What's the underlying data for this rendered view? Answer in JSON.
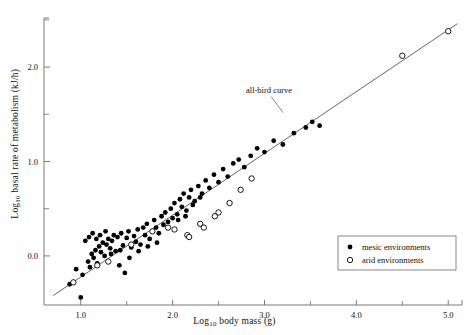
{
  "chart_data": {
    "type": "scatter",
    "title": "",
    "xlabel": "Log10 body mass (g)",
    "ylabel": "Log10 basal rate of metabolism (kJ/h)",
    "xlim": [
      0.6,
      5.15
    ],
    "ylim": [
      -0.52,
      2.52
    ],
    "xticks": [
      1.0,
      2.0,
      3.0,
      4.0,
      5.0
    ],
    "xticklabels": [
      "1.0",
      "2.0",
      "3.0",
      "4.0",
      "5.0"
    ],
    "xminorticks": [
      1.5,
      2.5,
      3.5,
      4.5
    ],
    "yticks": [
      0.0,
      1.0,
      2.0
    ],
    "yticklabels": [
      "0.0",
      "1.0",
      "2.0"
    ],
    "yminorticks": [
      0.5,
      1.5,
      2.5
    ],
    "grid": false,
    "legend_position": "lower-right",
    "annotations": [
      {
        "text": "all-bird curve",
        "x": 3.05,
        "y": 1.73
      }
    ],
    "fit_line": {
      "name": "all-bird curve",
      "x": [
        0.7,
        5.1
      ],
      "y": [
        -0.42,
        2.46
      ],
      "color": "#555555"
    },
    "series": [
      {
        "name": "mesic environments",
        "marker": "filled-circle",
        "color": "#000000",
        "points": [
          [
            0.88,
            -0.3
          ],
          [
            1.0,
            -0.44
          ],
          [
            0.95,
            -0.14
          ],
          [
            1.02,
            -0.2
          ],
          [
            1.08,
            -0.06
          ],
          [
            1.1,
            -0.12
          ],
          [
            1.12,
            0.02
          ],
          [
            1.14,
            -0.02
          ],
          [
            1.16,
            0.06
          ],
          [
            1.18,
            -0.08
          ],
          [
            1.2,
            0.1
          ],
          [
            1.22,
            0.04
          ],
          [
            1.24,
            0.14
          ],
          [
            1.26,
            0.0
          ],
          [
            1.28,
            0.12
          ],
          [
            1.3,
            0.18
          ],
          [
            1.32,
            0.08
          ],
          [
            1.34,
            0.16
          ],
          [
            1.36,
            0.22
          ],
          [
            1.38,
            0.05
          ],
          [
            1.4,
            0.2
          ],
          [
            1.42,
            -0.1
          ],
          [
            1.44,
            0.24
          ],
          [
            1.46,
            0.11
          ],
          [
            1.48,
            -0.18
          ],
          [
            1.5,
            0.19
          ],
          [
            1.52,
            0.26
          ],
          [
            1.55,
            0.09
          ],
          [
            1.58,
            0.21
          ],
          [
            1.6,
            0.15
          ],
          [
            1.62,
            0.28
          ],
          [
            1.65,
            0.12
          ],
          [
            1.68,
            0.3
          ],
          [
            1.7,
            0.22
          ],
          [
            1.72,
            0.34
          ],
          [
            1.75,
            0.18
          ],
          [
            1.78,
            0.26
          ],
          [
            1.8,
            0.38
          ],
          [
            1.82,
            0.3
          ],
          [
            1.85,
            0.24
          ],
          [
            1.88,
            0.42
          ],
          [
            1.9,
            0.33
          ],
          [
            1.92,
            0.46
          ],
          [
            1.95,
            0.36
          ],
          [
            1.98,
            0.5
          ],
          [
            2.0,
            0.4
          ],
          [
            2.02,
            0.56
          ],
          [
            2.05,
            0.44
          ],
          [
            2.08,
            0.6
          ],
          [
            2.1,
            0.52
          ],
          [
            2.12,
            0.66
          ],
          [
            2.15,
            0.48
          ],
          [
            2.18,
            0.62
          ],
          [
            2.2,
            0.7
          ],
          [
            2.24,
            0.58
          ],
          [
            2.28,
            0.74
          ],
          [
            2.32,
            0.66
          ],
          [
            2.36,
            0.8
          ],
          [
            2.4,
            0.72
          ],
          [
            2.45,
            0.86
          ],
          [
            2.5,
            0.78
          ],
          [
            2.55,
            0.92
          ],
          [
            2.6,
            0.84
          ],
          [
            2.66,
            0.98
          ],
          [
            2.72,
            1.02
          ],
          [
            2.78,
            0.94
          ],
          [
            2.85,
            1.06
          ],
          [
            2.92,
            1.14
          ],
          [
            3.0,
            1.1
          ],
          [
            3.1,
            1.22
          ],
          [
            3.2,
            1.18
          ],
          [
            3.32,
            1.3
          ],
          [
            3.45,
            1.36
          ],
          [
            3.52,
            1.42
          ],
          [
            3.6,
            1.38
          ],
          [
            1.05,
            0.16
          ],
          [
            1.09,
            0.2
          ],
          [
            1.13,
            0.24
          ],
          [
            1.17,
            0.18
          ],
          [
            1.21,
            0.22
          ],
          [
            1.27,
            0.26
          ],
          [
            1.33,
            0.02
          ],
          [
            1.43,
            0.06
          ],
          [
            1.53,
            -0.02
          ],
          [
            1.63,
            0.05
          ],
          [
            1.73,
            0.1
          ],
          [
            1.83,
            0.14
          ],
          [
            2.06,
            0.38
          ],
          [
            2.14,
            0.42
          ],
          [
            2.22,
            0.54
          ],
          [
            2.3,
            0.62
          ]
        ]
      },
      {
        "name": "arid environments",
        "marker": "open-circle",
        "color": "#000000",
        "points": [
          [
            0.92,
            -0.28
          ],
          [
            1.18,
            -0.1
          ],
          [
            1.3,
            -0.06
          ],
          [
            1.55,
            0.12
          ],
          [
            1.78,
            0.26
          ],
          [
            1.95,
            0.3
          ],
          [
            2.02,
            0.28
          ],
          [
            2.16,
            0.22
          ],
          [
            2.18,
            0.2
          ],
          [
            2.3,
            0.34
          ],
          [
            2.34,
            0.3
          ],
          [
            2.46,
            0.42
          ],
          [
            2.5,
            0.46
          ],
          [
            2.62,
            0.56
          ],
          [
            2.74,
            0.7
          ],
          [
            2.86,
            0.82
          ],
          [
            4.5,
            2.12
          ],
          [
            5.0,
            2.38
          ]
        ]
      }
    ]
  },
  "legend": {
    "items": [
      {
        "label": "mesic environments",
        "marker": "filled-circle"
      },
      {
        "label": "arid environments",
        "marker": "open-circle"
      }
    ]
  },
  "axis": {
    "x_title_parts": {
      "pre": "Log",
      "sub": "10",
      "post": " body mass (g)"
    },
    "y_title_parts": {
      "pre": "Log",
      "sub": "10",
      "post": " basal rate of metabolism (kJ/h)"
    }
  }
}
